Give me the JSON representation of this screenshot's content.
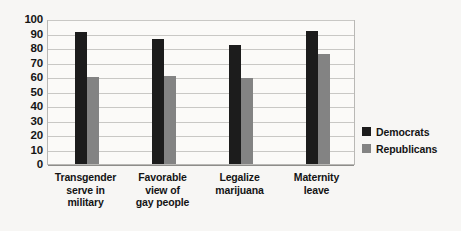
{
  "chart_data": {
    "type": "bar",
    "title": "",
    "subtitle": "",
    "xlabel": "",
    "ylabel": "",
    "ylim": [
      0,
      100
    ],
    "ytick_step": 10,
    "yticks": [
      "100",
      "90",
      "80",
      "70",
      "60",
      "50",
      "40",
      "30",
      "20",
      "10",
      "0"
    ],
    "grid": true,
    "legend_position": "right",
    "categories": [
      "Transgender serve in military",
      "Favorable view of gay people",
      "Legalize marijuana",
      "Maternity leave"
    ],
    "category_lines": [
      [
        "Transgender",
        "serve in",
        "military"
      ],
      [
        "Favorable",
        "view of",
        "gay people"
      ],
      [
        "Legalize",
        "marijuana"
      ],
      [
        "Maternity",
        "leave"
      ]
    ],
    "series": [
      {
        "name": "Democrats",
        "color": "#1c1c1c",
        "values": [
          91,
          86,
          82,
          92
        ]
      },
      {
        "name": "Republicans",
        "color": "#838383",
        "values": [
          60,
          61,
          59,
          76
        ]
      }
    ]
  },
  "legend": {
    "items": [
      {
        "label": "Democrats",
        "color": "#1c1c1c"
      },
      {
        "label": "Republicans",
        "color": "#838383"
      }
    ]
  }
}
